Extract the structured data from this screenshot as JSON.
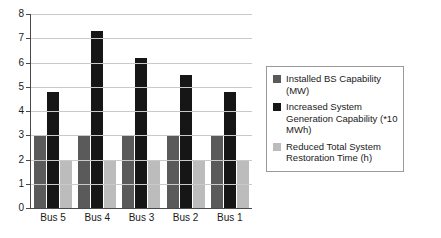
{
  "chart_data": {
    "type": "bar",
    "title": "",
    "subtitle": "",
    "xlabel": "",
    "ylabel": "",
    "ylim": [
      0,
      8
    ],
    "yticks": [
      0,
      1,
      2,
      3,
      4,
      5,
      6,
      7,
      8
    ],
    "grid": true,
    "legend_position": "right",
    "categories": [
      "Bus 5",
      "Bus 4",
      "Bus 3",
      "Bus 2",
      "Bus 1"
    ],
    "series": [
      {
        "name": "Installed BS Capability (MW)",
        "color": "#5a5a5a",
        "values": [
          3,
          3,
          3,
          3,
          3
        ]
      },
      {
        "name": "Increased System Generation Capability (*10 MWh)",
        "color": "#161616",
        "values": [
          4.8,
          7.3,
          6.2,
          5.5,
          4.8
        ]
      },
      {
        "name": "Reduced Total System Restoration Time (h)",
        "color": "#bcbcbc",
        "values": [
          2,
          2,
          2,
          2,
          2
        ]
      }
    ]
  },
  "axis": {
    "y_tick_labels": [
      "0",
      "1",
      "2",
      "3",
      "4",
      "5",
      "6",
      "7",
      "8"
    ]
  },
  "legend": {
    "items": [
      {
        "label": "Installed BS Capability (MW)"
      },
      {
        "label": "Increased System Generation Capability (*10 MWh)"
      },
      {
        "label": "Reduced Total System Restoration Time (h)"
      }
    ]
  }
}
